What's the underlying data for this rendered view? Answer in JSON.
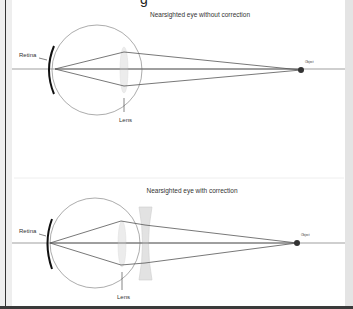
{
  "header": {
    "cut_off_title_fragment": "g"
  },
  "panels": [
    {
      "title": "Nearsighted eye without correction",
      "labels": {
        "retina": "Retina",
        "lens": "Lens",
        "object": "Object"
      },
      "has_corrective_lens": false
    },
    {
      "title": "Nearsighted eye with correction",
      "labels": {
        "retina": "Retina",
        "lens": "Lens",
        "object": "Object"
      },
      "has_corrective_lens": true
    }
  ],
  "colors": {
    "ray": "#555555",
    "axis": "#777777",
    "eyeball": "#888888",
    "retina": "#111111",
    "lens_fill": "#ececec",
    "object_dot": "#333333"
  }
}
